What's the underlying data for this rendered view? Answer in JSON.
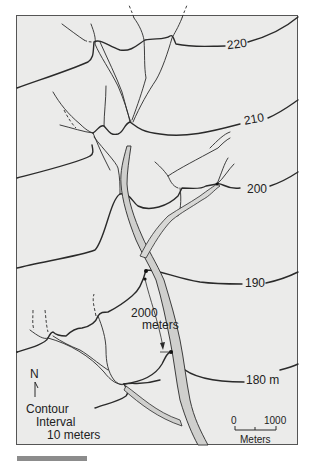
{
  "map": {
    "type": "topographic-contour-map",
    "background_color": "#ebebea",
    "line_color": "#2a2a2a",
    "channel_fill_color": "#cfcfcd",
    "contours": [
      {
        "label": "220",
        "elevation": 220
      },
      {
        "label": "210",
        "elevation": 210
      },
      {
        "label": "200",
        "elevation": 200
      },
      {
        "label": "190",
        "elevation": 190
      },
      {
        "label": "180 m",
        "elevation": 180
      }
    ],
    "distance_annotation": {
      "line1": "2000",
      "line2": "meters"
    },
    "north_arrow": {
      "label": "N"
    },
    "legend": {
      "line1": "Contour",
      "line2": "Interval",
      "line3": "10 meters"
    },
    "scale_bar": {
      "start": "0",
      "end": "1000",
      "unit": "Meters"
    }
  },
  "caption_bar": {
    "color": "#8c8c8c"
  }
}
